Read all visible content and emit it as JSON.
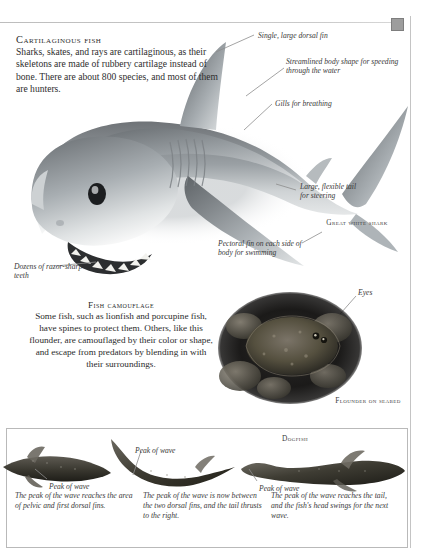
{
  "page": {
    "background_color": "#ffffff",
    "rule_color": "#c4c4c4",
    "marker_color": "#9d9d9d"
  },
  "intro": {
    "heading": "Cartilaginous fish",
    "body": "Sharks, skates, and rays are cartilaginous, as their skeletons are made of rubbery cartilage instead of bone. There are about 800 species, and most of them are hunters."
  },
  "shark": {
    "caption": "Great white shark",
    "labels": {
      "dorsal_fin": "Single, large dorsal fin",
      "streamlined": "Streamlined body shape for speeding through the water",
      "gills": "Gills for breathing",
      "tail": "Large, flexible tail for steering",
      "pectoral": "Pectoral fin on each side of body for swimming",
      "teeth": "Dozens of razor-sharp teeth"
    }
  },
  "camouflage": {
    "heading": "Fish camouflage",
    "body": "Some fish, such as lionfish and porcupine fish, have spines to protect them. Others, like this flounder, are camouflaged by their color or shape, and escape from predators by blending in with their surroundings.",
    "eyes_label": "Eyes",
    "caption": "Flounder on seabed"
  },
  "swimming_panel": {
    "species_caption": "Dogfish",
    "stages": [
      {
        "peak_label": "Peak of wave",
        "text": "The peak of the wave reaches the area of pelvic and first dorsal fins."
      },
      {
        "peak_label": "Peak of wave",
        "text": "The peak of the wave is now between the two dorsal fins, and the tail thrusts to the right."
      },
      {
        "peak_label": "Peak of wave",
        "text": "The peak of the wave reaches the tail, and the fish's head swings for the next wave."
      }
    ]
  }
}
